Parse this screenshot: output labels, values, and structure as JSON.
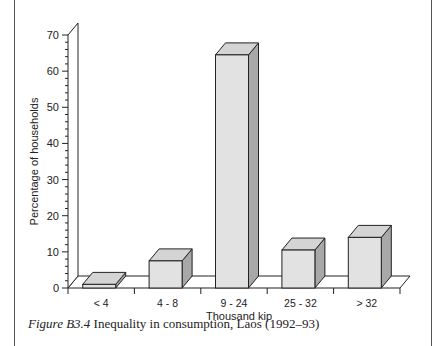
{
  "chart_data": {
    "type": "bar",
    "style": "3d",
    "title": "",
    "categories": [
      "< 4",
      "4 - 8",
      "9 - 24",
      "25 - 32",
      "> 32"
    ],
    "values": [
      1,
      7.5,
      64.5,
      10.5,
      14
    ],
    "xlabel": "Thousand kip",
    "ylabel": "Percentage of households",
    "ylim": [
      0,
      70
    ],
    "yticks": [
      0,
      10,
      20,
      30,
      40,
      50,
      60,
      70
    ],
    "grid": false,
    "legend": null,
    "bar_color": "#e2e2e2",
    "bar_side_color": "#a8a8a8",
    "bar_top_color": "#d4d4d4"
  },
  "caption": {
    "figure_label": "Figure B3.4",
    "text": "Inequality in consumption, Laos (1992–93)"
  }
}
